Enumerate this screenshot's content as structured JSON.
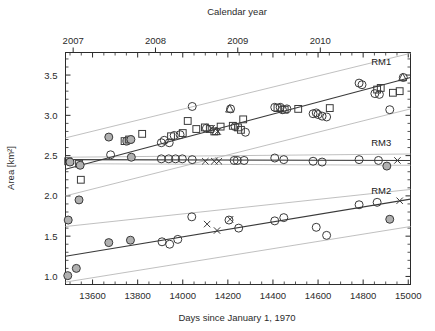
{
  "chart_data": {
    "type": "scatter",
    "title": "",
    "xlabel": "Days since January 1, 1970",
    "ylabel": "Area [km²]",
    "secondary_xlabel": "Calendar year",
    "xlim": [
      13480,
      15010
    ],
    "ylim": [
      0.9,
      3.78
    ],
    "xticks": [
      13600,
      13800,
      14000,
      14200,
      14400,
      14600,
      14800,
      15000
    ],
    "xticklabels": [
      "13600",
      "13800",
      "14000",
      "14200",
      "14400",
      "14600",
      "14800",
      "15000"
    ],
    "yticks": [
      1.0,
      1.5,
      2.0,
      2.5,
      3.0,
      3.5
    ],
    "yticklabels": [
      "1.0",
      "1.5",
      "2.0",
      "2.5",
      "3.0",
      "3.5"
    ],
    "top_ticks": [
      13514,
      13879,
      14244,
      14610
    ],
    "top_ticklabels": [
      "2007",
      "2008",
      "2009",
      "2010"
    ],
    "grid": false,
    "legend_position": "inline-right",
    "annotations": [
      {
        "label": "RM1",
        "x": 14880,
        "y": 3.62
      },
      {
        "label": "RM3",
        "x": 14880,
        "y": 2.62
      },
      {
        "label": "RM2",
        "x": 14880,
        "y": 2.02
      }
    ],
    "series": [
      {
        "name": "RM1",
        "marker_types": [
          "open-circle",
          "filled-circle",
          "square",
          "triangle",
          "x"
        ],
        "trend": {
          "x0": 13480,
          "y0": 2.33,
          "x1": 15010,
          "y1": 3.47
        },
        "band_upper": {
          "x0": 13480,
          "y0": 2.72,
          "x1": 15010,
          "y1": 3.77
        },
        "band_lower": {
          "x0": 13480,
          "y0": 2.0,
          "x1": 15010,
          "y1": 3.08
        },
        "points": [
          {
            "x": 13492,
            "y": 2.43,
            "m": "square"
          },
          {
            "x": 13500,
            "y": 2.42,
            "m": "filled-circle"
          },
          {
            "x": 13540,
            "y": 2.4,
            "m": "square"
          },
          {
            "x": 13545,
            "y": 2.38,
            "m": "filled-circle"
          },
          {
            "x": 13548,
            "y": 2.2,
            "m": "square"
          },
          {
            "x": 13672,
            "y": 2.73,
            "m": "filled-circle"
          },
          {
            "x": 13680,
            "y": 2.51,
            "m": "open-circle"
          },
          {
            "x": 13742,
            "y": 2.68,
            "m": "square"
          },
          {
            "x": 13752,
            "y": 2.68,
            "m": "filled-circle"
          },
          {
            "x": 13762,
            "y": 2.7,
            "m": "square"
          },
          {
            "x": 13770,
            "y": 2.7,
            "m": "filled-circle"
          },
          {
            "x": 13772,
            "y": 2.48,
            "m": "filled-circle"
          },
          {
            "x": 13820,
            "y": 2.77,
            "m": "square"
          },
          {
            "x": 13905,
            "y": 2.66,
            "m": "open-circle"
          },
          {
            "x": 13918,
            "y": 2.69,
            "m": "open-circle"
          },
          {
            "x": 13940,
            "y": 2.66,
            "m": "open-circle"
          },
          {
            "x": 13948,
            "y": 2.74,
            "m": "square"
          },
          {
            "x": 13962,
            "y": 2.75,
            "m": "open-circle"
          },
          {
            "x": 13988,
            "y": 2.76,
            "m": "open-circle"
          },
          {
            "x": 14000,
            "y": 2.78,
            "m": "square"
          },
          {
            "x": 14022,
            "y": 2.93,
            "m": "square"
          },
          {
            "x": 14042,
            "y": 3.11,
            "m": "open-circle"
          },
          {
            "x": 14060,
            "y": 2.83,
            "m": "square"
          },
          {
            "x": 14098,
            "y": 2.85,
            "m": "square"
          },
          {
            "x": 14105,
            "y": 2.84,
            "m": "open-circle"
          },
          {
            "x": 14120,
            "y": 2.83,
            "m": "square"
          },
          {
            "x": 14128,
            "y": 2.84,
            "m": "x"
          },
          {
            "x": 14140,
            "y": 2.8,
            "m": "square"
          },
          {
            "x": 14148,
            "y": 2.8,
            "m": "triangle"
          },
          {
            "x": 14155,
            "y": 2.8,
            "m": "x"
          },
          {
            "x": 14168,
            "y": 2.86,
            "m": "square"
          },
          {
            "x": 14208,
            "y": 3.08,
            "m": "triangle"
          },
          {
            "x": 14212,
            "y": 3.08,
            "m": "open-circle"
          },
          {
            "x": 14222,
            "y": 2.87,
            "m": "square"
          },
          {
            "x": 14232,
            "y": 2.86,
            "m": "open-circle"
          },
          {
            "x": 14245,
            "y": 2.85,
            "m": "square"
          },
          {
            "x": 14258,
            "y": 2.82,
            "m": "square"
          },
          {
            "x": 14268,
            "y": 2.95,
            "m": "square"
          },
          {
            "x": 14278,
            "y": 2.79,
            "m": "open-circle"
          },
          {
            "x": 14408,
            "y": 3.1,
            "m": "open-circle"
          },
          {
            "x": 14420,
            "y": 3.09,
            "m": "square"
          },
          {
            "x": 14432,
            "y": 3.1,
            "m": "open-circle"
          },
          {
            "x": 14442,
            "y": 3.07,
            "m": "open-circle"
          },
          {
            "x": 14452,
            "y": 3.07,
            "m": "square"
          },
          {
            "x": 14462,
            "y": 3.08,
            "m": "open-circle"
          },
          {
            "x": 14512,
            "y": 3.08,
            "m": "square"
          },
          {
            "x": 14578,
            "y": 3.02,
            "m": "open-circle"
          },
          {
            "x": 14592,
            "y": 3.03,
            "m": "open-circle"
          },
          {
            "x": 14600,
            "y": 3.01,
            "m": "open-circle"
          },
          {
            "x": 14618,
            "y": 2.99,
            "m": "open-circle"
          },
          {
            "x": 14638,
            "y": 2.98,
            "m": "open-circle"
          },
          {
            "x": 14652,
            "y": 3.09,
            "m": "square"
          },
          {
            "x": 14782,
            "y": 3.4,
            "m": "open-circle"
          },
          {
            "x": 14795,
            "y": 3.38,
            "m": "open-circle"
          },
          {
            "x": 14852,
            "y": 3.27,
            "m": "open-circle"
          },
          {
            "x": 14862,
            "y": 3.32,
            "m": "square"
          },
          {
            "x": 14872,
            "y": 3.26,
            "m": "open-circle"
          },
          {
            "x": 14878,
            "y": 3.34,
            "m": "square"
          },
          {
            "x": 14918,
            "y": 3.07,
            "m": "open-circle"
          },
          {
            "x": 14932,
            "y": 3.28,
            "m": "square"
          },
          {
            "x": 14962,
            "y": 3.3,
            "m": "square"
          },
          {
            "x": 14975,
            "y": 3.47,
            "m": "triangle"
          },
          {
            "x": 14978,
            "y": 3.47,
            "m": "open-circle"
          }
        ]
      },
      {
        "name": "RM3",
        "marker_types": [
          "open-circle",
          "filled-circle",
          "x"
        ],
        "trend": {
          "x0": 13480,
          "y0": 2.45,
          "x1": 15010,
          "y1": 2.44
        },
        "band_upper": {
          "x0": 13480,
          "y0": 2.48,
          "x1": 15010,
          "y1": 2.52
        },
        "band_lower": {
          "x0": 13480,
          "y0": 2.4,
          "x1": 15010,
          "y1": 2.38
        },
        "points": [
          {
            "x": 13905,
            "y": 2.46,
            "m": "open-circle"
          },
          {
            "x": 13938,
            "y": 2.46,
            "m": "open-circle"
          },
          {
            "x": 13968,
            "y": 2.46,
            "m": "open-circle"
          },
          {
            "x": 13998,
            "y": 2.46,
            "m": "open-circle"
          },
          {
            "x": 14042,
            "y": 2.45,
            "m": "open-circle"
          },
          {
            "x": 14100,
            "y": 2.43,
            "m": "x"
          },
          {
            "x": 14140,
            "y": 2.43,
            "m": "x"
          },
          {
            "x": 14160,
            "y": 2.43,
            "m": "x"
          },
          {
            "x": 14228,
            "y": 2.44,
            "m": "open-circle"
          },
          {
            "x": 14242,
            "y": 2.44,
            "m": "open-circle"
          },
          {
            "x": 14272,
            "y": 2.44,
            "m": "open-circle"
          },
          {
            "x": 14408,
            "y": 2.47,
            "m": "open-circle"
          },
          {
            "x": 14448,
            "y": 2.45,
            "m": "open-circle"
          },
          {
            "x": 14578,
            "y": 2.43,
            "m": "open-circle"
          },
          {
            "x": 14618,
            "y": 2.42,
            "m": "open-circle"
          },
          {
            "x": 14782,
            "y": 2.45,
            "m": "open-circle"
          },
          {
            "x": 14868,
            "y": 2.44,
            "m": "open-circle"
          },
          {
            "x": 14905,
            "y": 2.37,
            "m": "filled-circle"
          },
          {
            "x": 14952,
            "y": 2.44,
            "m": "x"
          }
        ]
      },
      {
        "name": "RM2",
        "marker_types": [
          "open-circle",
          "filled-circle",
          "x"
        ],
        "trend": {
          "x0": 13480,
          "y0": 1.25,
          "x1": 15010,
          "y1": 1.96
        },
        "band_upper": {
          "x0": 13480,
          "y0": 1.62,
          "x1": 15010,
          "y1": 2.08
        },
        "band_lower": {
          "x0": 13480,
          "y0": 0.93,
          "x1": 15010,
          "y1": 1.62
        },
        "points": [
          {
            "x": 13490,
            "y": 1.01,
            "m": "filled-circle"
          },
          {
            "x": 13492,
            "y": 1.7,
            "m": "filled-circle"
          },
          {
            "x": 13528,
            "y": 1.1,
            "m": "filled-circle"
          },
          {
            "x": 13540,
            "y": 1.95,
            "m": "filled-circle"
          },
          {
            "x": 13672,
            "y": 1.42,
            "m": "filled-circle"
          },
          {
            "x": 13768,
            "y": 1.45,
            "m": "filled-circle"
          },
          {
            "x": 13908,
            "y": 1.43,
            "m": "open-circle"
          },
          {
            "x": 13942,
            "y": 1.4,
            "m": "open-circle"
          },
          {
            "x": 13978,
            "y": 1.46,
            "m": "open-circle"
          },
          {
            "x": 14040,
            "y": 1.74,
            "m": "open-circle"
          },
          {
            "x": 14108,
            "y": 1.65,
            "m": "x"
          },
          {
            "x": 14152,
            "y": 1.57,
            "m": "x"
          },
          {
            "x": 14210,
            "y": 1.71,
            "m": "x"
          },
          {
            "x": 14205,
            "y": 1.7,
            "m": "open-circle"
          },
          {
            "x": 14248,
            "y": 1.6,
            "m": "open-circle"
          },
          {
            "x": 14408,
            "y": 1.69,
            "m": "open-circle"
          },
          {
            "x": 14448,
            "y": 1.73,
            "m": "open-circle"
          },
          {
            "x": 14592,
            "y": 1.61,
            "m": "open-circle"
          },
          {
            "x": 14638,
            "y": 1.51,
            "m": "open-circle"
          },
          {
            "x": 14782,
            "y": 1.89,
            "m": "open-circle"
          },
          {
            "x": 14862,
            "y": 1.92,
            "m": "open-circle"
          },
          {
            "x": 14918,
            "y": 1.71,
            "m": "filled-circle"
          },
          {
            "x": 14962,
            "y": 1.94,
            "m": "x"
          }
        ]
      }
    ]
  },
  "style": {
    "axis_color": "#2b2b2b",
    "trend_color": "#3a3a3a",
    "band_color": "#b9b9b9",
    "marker_edge": "#3a3a3a",
    "marker_fill_gray": "#b0b0b0",
    "background": "#ffffff"
  }
}
